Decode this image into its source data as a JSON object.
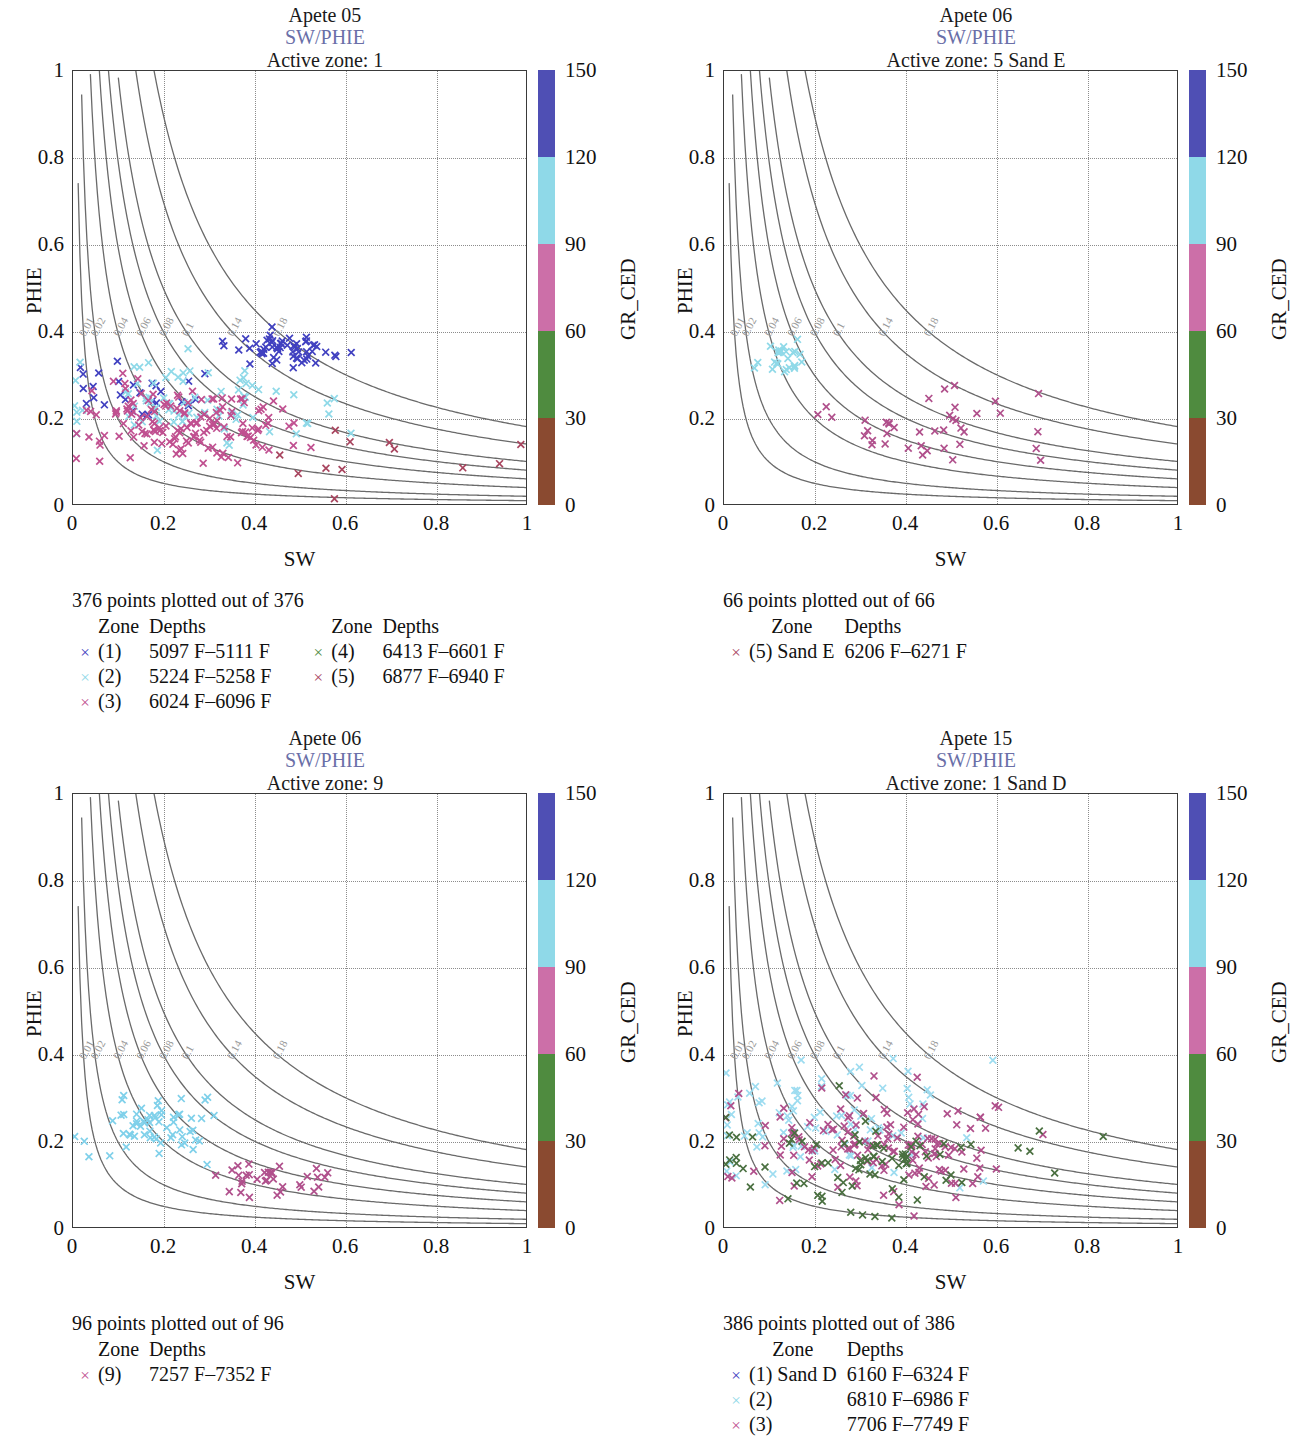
{
  "figure": {
    "axis_x_label": "SW",
    "axis_y_label": "PHIE",
    "colorbar_label": "GR_CED",
    "crossplot_label": "SW/PHIE",
    "x_ticks": [
      "0",
      "0.2",
      "0.4",
      "0.6",
      "0.8",
      "1"
    ],
    "y_ticks": [
      "0",
      "0.2",
      "0.4",
      "0.6",
      "0.8",
      "1"
    ],
    "colorbar_ticks": [
      "0",
      "30",
      "60",
      "90",
      "120",
      "150"
    ],
    "colorbar_colors": [
      "#4f4fb4",
      "#8fd9e8",
      "#cc6fa8",
      "#4f8b3f",
      "#8a4a30"
    ],
    "bvw_curve_labels": [
      "0.01",
      "0.02",
      "0.04",
      "0.06",
      "0.08",
      "0.1",
      "0.14",
      "0.18"
    ],
    "legend_head_zone": "Zone",
    "legend_head_depths": "Depths",
    "marker_glyph": "×"
  },
  "chart_data": {
    "type": "scatter",
    "xlabel": "SW",
    "ylabel": "PHIE",
    "xlim": [
      0,
      1
    ],
    "ylim": [
      0,
      1
    ],
    "grid": "dotted at 0.2 intervals",
    "colorbar": {
      "label": "GR_CED",
      "ticks": [
        0,
        30,
        60,
        90,
        120,
        150
      ],
      "bands": [
        {
          "range": [
            0,
            30
          ],
          "color": "#4f4fb4"
        },
        {
          "range": [
            30,
            60
          ],
          "color": "#8fd9e8"
        },
        {
          "range": [
            60,
            90
          ],
          "color": "#cc6fa8"
        },
        {
          "range": [
            90,
            120
          ],
          "color": "#4f8b3f"
        },
        {
          "range": [
            120,
            150
          ],
          "color": "#8a4a30"
        }
      ]
    },
    "overlay_curves": {
      "type": "hyperbola",
      "equation": "PHIE = BVW / SW",
      "bvw_values": [
        0.01,
        0.02,
        0.04,
        0.06,
        0.08,
        0.1,
        0.14,
        0.18
      ]
    },
    "panels": [
      {
        "well": "Apete 05",
        "crossplot": "SW/PHIE",
        "active_zone": "Active zone: 1",
        "points_text": "376 points plotted out of 376",
        "points_plotted": 376,
        "points_total": 376,
        "legend_left": [
          {
            "zone": "(1)",
            "depths": "5097 F–5111 F",
            "color": "#4040c0"
          },
          {
            "zone": "(2)",
            "depths": "5224 F–5258 F",
            "color": "#8fd9e8"
          },
          {
            "zone": "(3)",
            "depths": "6024 F–6096 F",
            "color": "#c05090"
          }
        ],
        "legend_right": [
          {
            "zone": "(4)",
            "depths": "6413 F–6601 F",
            "color": "#4f8b3f"
          },
          {
            "zone": "(5)",
            "depths": "6877 F–6940 F",
            "color": "#a8455f"
          }
        ],
        "clusters": [
          {
            "color": "#4040c0",
            "n": 60,
            "cx": 0.47,
            "cy": 0.355,
            "sx": 0.055,
            "sy": 0.018
          },
          {
            "color": "#4040c0",
            "n": 28,
            "cx": 0.13,
            "cy": 0.26,
            "sx": 0.09,
            "sy": 0.035
          },
          {
            "color": "#8fd9e8",
            "n": 80,
            "cx": 0.27,
            "cy": 0.24,
            "sx": 0.14,
            "sy": 0.05
          },
          {
            "color": "#c05090",
            "n": 150,
            "cx": 0.26,
            "cy": 0.185,
            "sx": 0.12,
            "sy": 0.035
          },
          {
            "color": "#a8455f",
            "n": 12,
            "cx": 0.6,
            "cy": 0.12,
            "sx": 0.18,
            "sy": 0.05
          }
        ]
      },
      {
        "well": "Apete 06",
        "crossplot": "SW/PHIE",
        "active_zone": "Active zone: 5 Sand E",
        "points_text": "66 points plotted out of 66",
        "points_plotted": 66,
        "points_total": 66,
        "legend_left": [
          {
            "zone": "(5) Sand E",
            "depths": "6206 F–6271 F",
            "color": "#a8455f"
          }
        ],
        "legend_right": [],
        "clusters": [
          {
            "color": "#8fd9e8",
            "n": 26,
            "cx": 0.14,
            "cy": 0.335,
            "sx": 0.03,
            "sy": 0.02
          },
          {
            "color": "#b0508c",
            "n": 40,
            "cx": 0.45,
            "cy": 0.185,
            "sx": 0.13,
            "sy": 0.045
          }
        ]
      },
      {
        "well": "Apete 06",
        "crossplot": "SW/PHIE",
        "active_zone": "Active zone: 9",
        "points_text": "96 points plotted out of 96",
        "points_plotted": 96,
        "points_total": 96,
        "legend_left": [
          {
            "zone": "(9)",
            "depths": "7257 F–7352 F",
            "color": "#c05090"
          }
        ],
        "legend_right": [],
        "clusters": [
          {
            "color": "#7fd0ea",
            "n": 62,
            "cx": 0.18,
            "cy": 0.235,
            "sx": 0.065,
            "sy": 0.035
          },
          {
            "color": "#b0508c",
            "n": 34,
            "cx": 0.42,
            "cy": 0.115,
            "sx": 0.085,
            "sy": 0.022
          }
        ]
      },
      {
        "well": "Apete 15",
        "crossplot": "SW/PHIE",
        "active_zone": "Active zone: 1 Sand D",
        "points_text": "386 points plotted out of 386",
        "points_plotted": 386,
        "points_total": 386,
        "legend_left": [
          {
            "zone": "(1) Sand D",
            "depths": "6160 F–6324 F",
            "color": "#4040c0"
          },
          {
            "zone": "(2)",
            "depths": "6810 F–6986 F",
            "color": "#8fd9e8"
          },
          {
            "zone": "(3)",
            "depths": "7706 F–7749 F",
            "color": "#c05090"
          }
        ],
        "legend_right": [],
        "clusters": [
          {
            "color": "#9ddcf0",
            "n": 90,
            "cx": 0.22,
            "cy": 0.245,
            "sx": 0.18,
            "sy": 0.075
          },
          {
            "color": "#b0508c",
            "n": 150,
            "cx": 0.33,
            "cy": 0.185,
            "sx": 0.16,
            "sy": 0.055
          },
          {
            "color": "#4a7040",
            "n": 85,
            "cx": 0.32,
            "cy": 0.15,
            "sx": 0.19,
            "sy": 0.055
          }
        ]
      }
    ]
  }
}
